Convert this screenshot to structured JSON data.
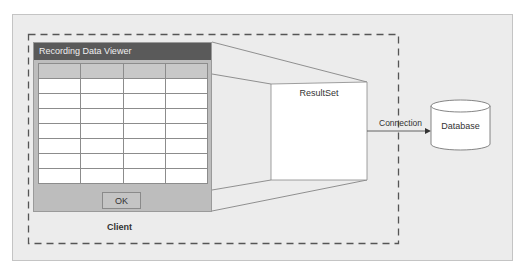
{
  "diagram": {
    "client": {
      "label": "Client",
      "window": {
        "title": "Recording Data Viewer",
        "columns": [
          "",
          "",
          "",
          ""
        ],
        "rows": [
          [
            "",
            "",
            "",
            ""
          ],
          [
            "",
            "",
            "",
            ""
          ],
          [
            "",
            "",
            "",
            ""
          ],
          [
            "",
            "",
            "",
            ""
          ],
          [
            "",
            "",
            "",
            ""
          ],
          [
            "",
            "",
            "",
            ""
          ],
          [
            "",
            "",
            "",
            ""
          ]
        ],
        "ok_label": "OK"
      }
    },
    "resultset": {
      "label": "ResultSet"
    },
    "connection": {
      "label": "Connection"
    },
    "database": {
      "label": "Database"
    }
  },
  "colors": {
    "panel_bg": "#ececec",
    "titlebar_bg": "#5a5a5a",
    "window_bg": "#bdbdbd",
    "dash": "#555555"
  }
}
